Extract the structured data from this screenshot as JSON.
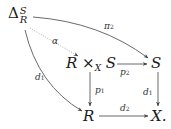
{
  "diagram": {
    "type": "commutative-diagram",
    "nodes": {
      "delta": {
        "base": "Δ",
        "sup": "S",
        "sub": "R"
      },
      "fiber_product": {
        "left": "R",
        "times": "×",
        "sub": "X",
        "right": "S"
      },
      "s": {
        "label": "S"
      },
      "r": {
        "label": "R"
      },
      "x": {
        "label": "X."
      }
    },
    "arrows": [
      {
        "from": "delta",
        "to": "s",
        "label": "π",
        "label_sub": "2",
        "style": "solid-curved"
      },
      {
        "from": "delta",
        "to": "fiber_product",
        "label": "α",
        "style": "dotted"
      },
      {
        "from": "delta",
        "to": "r",
        "label": "d",
        "label_sub": "1",
        "style": "solid-curved"
      },
      {
        "from": "fiber_product",
        "to": "s",
        "label": "p",
        "label_sub": "2",
        "style": "solid"
      },
      {
        "from": "fiber_product",
        "to": "r",
        "label": "p",
        "label_sub": "1",
        "style": "solid"
      },
      {
        "from": "s",
        "to": "x",
        "label": "d",
        "label_sub": "1",
        "style": "solid"
      },
      {
        "from": "r",
        "to": "x",
        "label": "d",
        "label_sub": "2",
        "style": "solid"
      }
    ],
    "colors": {
      "ink": "#1a1a1a",
      "arrow": "#444444",
      "dotted": "#888888"
    }
  }
}
